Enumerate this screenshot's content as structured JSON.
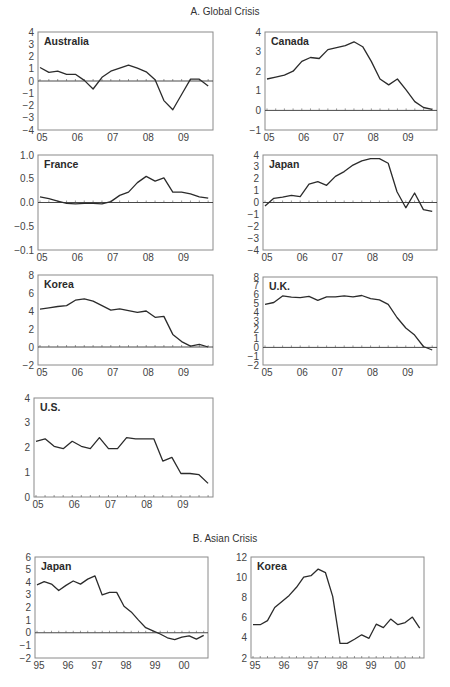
{
  "sections": {
    "a_title": "A. Global Crisis",
    "b_title": "B. Asian Crisis"
  },
  "chart_data": [
    {
      "type": "line",
      "section": "A. Global Crisis",
      "title": "Australia",
      "x_tick_labels": [
        "05",
        "06",
        "07",
        "08",
        "09"
      ],
      "y_tick_labels": [
        "4",
        "3",
        "2",
        "1",
        "0",
        "−1",
        "−2",
        "−3",
        "−4"
      ],
      "ylim": [
        -4,
        4
      ],
      "xlim": [
        2005.0,
        2009.83
      ],
      "x": [
        2005.0,
        2005.25,
        2005.5,
        2005.75,
        2006.0,
        2006.25,
        2006.5,
        2006.75,
        2007.0,
        2007.25,
        2007.5,
        2007.75,
        2008.0,
        2008.25,
        2008.5,
        2008.75,
        2009.0,
        2009.25,
        2009.5,
        2009.75
      ],
      "values": [
        1.1,
        0.7,
        0.8,
        0.55,
        0.55,
        0.05,
        -0.65,
        0.3,
        0.8,
        1.05,
        1.3,
        1.05,
        0.75,
        0.1,
        -1.6,
        -2.35,
        -1.1,
        0.15,
        0.15,
        -0.4
      ]
    },
    {
      "type": "line",
      "section": "A. Global Crisis",
      "title": "Canada",
      "x_tick_labels": [
        "05",
        "06",
        "07",
        "08",
        "09"
      ],
      "y_tick_labels": [
        "4",
        "3",
        "2",
        "1",
        "0",
        "−1"
      ],
      "ylim": [
        -1,
        4
      ],
      "xlim": [
        2005.0,
        2009.83
      ],
      "x": [
        2005.0,
        2005.25,
        2005.5,
        2005.75,
        2006.0,
        2006.25,
        2006.5,
        2006.75,
        2007.0,
        2007.25,
        2007.5,
        2007.75,
        2008.0,
        2008.25,
        2008.5,
        2008.75,
        2009.0,
        2009.25,
        2009.5,
        2009.75
      ],
      "values": [
        1.6,
        1.7,
        1.8,
        2.0,
        2.5,
        2.7,
        2.65,
        3.1,
        3.2,
        3.3,
        3.5,
        3.25,
        2.5,
        1.6,
        1.3,
        1.6,
        1.05,
        0.45,
        0.15,
        0.05
      ]
    },
    {
      "type": "line",
      "section": "A. Global Crisis",
      "title": "France",
      "x_tick_labels": [
        "05",
        "06",
        "07",
        "08",
        "09"
      ],
      "y_tick_labels": [
        "1.0",
        "0.5",
        "0.0",
        "−0.5",
        "−0.1"
      ],
      "ylim": [
        -1.0,
        1.0
      ],
      "xlim": [
        2005.0,
        2009.83
      ],
      "x": [
        2005.0,
        2005.25,
        2005.5,
        2005.75,
        2006.0,
        2006.25,
        2006.5,
        2006.75,
        2007.0,
        2007.25,
        2007.5,
        2007.75,
        2008.0,
        2008.25,
        2008.5,
        2008.75,
        2009.0,
        2009.25,
        2009.5,
        2009.75
      ],
      "values": [
        0.12,
        0.08,
        0.03,
        -0.02,
        -0.03,
        -0.02,
        -0.02,
        -0.03,
        0.02,
        0.15,
        0.22,
        0.42,
        0.55,
        0.45,
        0.52,
        0.22,
        0.22,
        0.18,
        0.12,
        0.09
      ]
    },
    {
      "type": "line",
      "section": "A. Global Crisis",
      "title": "Japan",
      "x_tick_labels": [
        "05",
        "06",
        "07",
        "08",
        "09"
      ],
      "y_tick_labels": [
        "4",
        "3",
        "2",
        "1",
        "0",
        "−1",
        "−2",
        "−3",
        "−4"
      ],
      "ylim": [
        -4,
        4
      ],
      "xlim": [
        2005.0,
        2009.83
      ],
      "x": [
        2005.0,
        2005.25,
        2005.5,
        2005.75,
        2006.0,
        2006.25,
        2006.5,
        2006.75,
        2007.0,
        2007.25,
        2007.5,
        2007.75,
        2008.0,
        2008.25,
        2008.5,
        2008.75,
        2009.0,
        2009.25,
        2009.5,
        2009.75
      ],
      "values": [
        -0.3,
        0.35,
        0.45,
        0.6,
        0.5,
        1.55,
        1.75,
        1.45,
        2.2,
        2.6,
        3.15,
        3.5,
        3.7,
        3.7,
        3.3,
        0.9,
        -0.45,
        0.8,
        -0.6,
        -0.75
      ]
    },
    {
      "type": "line",
      "section": "A. Global Crisis",
      "title": "Korea",
      "x_tick_labels": [
        "05",
        "06",
        "07",
        "08",
        "09"
      ],
      "y_tick_labels": [
        "8",
        "6",
        "4",
        "2",
        "0",
        "−2"
      ],
      "ylim": [
        -2,
        8
      ],
      "xlim": [
        2005.0,
        2009.83
      ],
      "x": [
        2005.0,
        2005.25,
        2005.5,
        2005.75,
        2006.0,
        2006.25,
        2006.5,
        2006.75,
        2007.0,
        2007.25,
        2007.5,
        2007.75,
        2008.0,
        2008.25,
        2008.5,
        2008.75,
        2009.0,
        2009.25,
        2009.5,
        2009.75
      ],
      "values": [
        4.2,
        4.35,
        4.5,
        4.6,
        5.2,
        5.35,
        5.1,
        4.6,
        4.1,
        4.25,
        4.05,
        3.85,
        4.0,
        3.3,
        3.4,
        1.4,
        0.6,
        0.1,
        0.3,
        0.0
      ]
    },
    {
      "type": "line",
      "section": "A. Global Crisis",
      "title": "U.K.",
      "x_tick_labels": [
        "05",
        "06",
        "07",
        "08",
        "09"
      ],
      "y_tick_labels": [
        "8",
        "7",
        "6",
        "5",
        "4",
        "3",
        "2",
        "1",
        "0",
        "−1",
        "−2"
      ],
      "ylim": [
        -2,
        8
      ],
      "xlim": [
        2005.0,
        2009.83
      ],
      "x": [
        2005.0,
        2005.25,
        2005.5,
        2005.75,
        2006.0,
        2006.25,
        2006.5,
        2006.75,
        2007.0,
        2007.25,
        2007.5,
        2007.75,
        2008.0,
        2008.25,
        2008.5,
        2008.75,
        2009.0,
        2009.25,
        2009.5,
        2009.75
      ],
      "values": [
        4.9,
        5.1,
        5.85,
        5.7,
        5.65,
        5.8,
        5.35,
        5.75,
        5.75,
        5.85,
        5.75,
        5.9,
        5.55,
        5.4,
        4.9,
        3.4,
        2.2,
        1.4,
        0.1,
        -0.3
      ]
    },
    {
      "type": "line",
      "section": "A. Global Crisis",
      "title": "U.S.",
      "x_tick_labels": [
        "05",
        "06",
        "07",
        "08",
        "09"
      ],
      "y_tick_labels": [
        "4",
        "3",
        "2",
        "1",
        "0"
      ],
      "ylim": [
        0,
        4
      ],
      "xlim": [
        2005.0,
        2009.83
      ],
      "x": [
        2005.0,
        2005.25,
        2005.5,
        2005.75,
        2006.0,
        2006.25,
        2006.5,
        2006.75,
        2007.0,
        2007.25,
        2007.5,
        2007.75,
        2008.0,
        2008.25,
        2008.5,
        2008.75,
        2009.0,
        2009.25,
        2009.5,
        2009.75
      ],
      "values": [
        2.25,
        2.35,
        2.05,
        1.95,
        2.25,
        2.05,
        1.95,
        2.4,
        1.95,
        1.95,
        2.4,
        2.35,
        2.35,
        2.35,
        1.45,
        1.6,
        0.95,
        0.95,
        0.9,
        0.55
      ]
    },
    {
      "type": "line",
      "section": "B. Asian Crisis",
      "title": "Japan",
      "x_tick_labels": [
        "95",
        "96",
        "97",
        "98",
        "99",
        "00"
      ],
      "y_tick_labels": [
        "6",
        "5",
        "4",
        "3",
        "2",
        "1",
        "0",
        "−1",
        "−2"
      ],
      "ylim": [
        -2,
        6
      ],
      "xlim": [
        1995.0,
        2000.83
      ],
      "x": [
        1995.0,
        1995.25,
        1995.5,
        1995.75,
        1996.0,
        1996.25,
        1996.5,
        1996.75,
        1997.0,
        1997.25,
        1997.5,
        1997.75,
        1998.0,
        1998.25,
        1998.5,
        1998.75,
        1999.0,
        1999.25,
        1999.5,
        1999.75,
        2000.0,
        2000.25,
        2000.5,
        2000.75
      ],
      "values": [
        3.8,
        4.05,
        3.85,
        3.35,
        3.75,
        4.1,
        3.85,
        4.25,
        4.5,
        3.0,
        3.2,
        3.2,
        2.1,
        1.65,
        1.0,
        0.4,
        0.15,
        -0.1,
        -0.4,
        -0.55,
        -0.35,
        -0.25,
        -0.5,
        -0.2
      ]
    },
    {
      "type": "line",
      "section": "B. Asian Crisis",
      "title": "Korea",
      "x_tick_labels": [
        "95",
        "96",
        "97",
        "98",
        "99",
        "00"
      ],
      "y_tick_labels": [
        "12",
        "10",
        "8",
        "6",
        "4",
        "2"
      ],
      "ylim": [
        2,
        12
      ],
      "xlim": [
        1995.0,
        2000.83
      ],
      "x": [
        1995.0,
        1995.25,
        1995.5,
        1995.75,
        1996.0,
        1996.25,
        1996.5,
        1996.75,
        1997.0,
        1997.25,
        1997.5,
        1997.75,
        1998.0,
        1998.25,
        1998.5,
        1998.75,
        1999.0,
        1999.25,
        1999.5,
        1999.75,
        2000.0,
        2000.25,
        2000.5,
        2000.75
      ],
      "values": [
        5.3,
        5.3,
        5.7,
        7.0,
        7.6,
        8.2,
        9.0,
        10.0,
        10.15,
        10.8,
        10.45,
        8.1,
        3.45,
        3.45,
        3.85,
        4.3,
        3.95,
        5.35,
        5.0,
        5.85,
        5.3,
        5.5,
        6.05,
        4.95
      ]
    }
  ],
  "panels": [
    {
      "x0": 38,
      "x1": 213,
      "y0": 32,
      "y1": 130,
      "gap": [
        0,
        3,
        2,
        5
      ]
    },
    {
      "x0": 265,
      "x1": 437,
      "y0": 32,
      "y1": 130
    },
    {
      "x0": 38,
      "x1": 213,
      "y0": 155,
      "y1": 250
    },
    {
      "x0": 263,
      "x1": 437,
      "y0": 155,
      "y1": 250
    },
    {
      "x0": 38,
      "x1": 213,
      "y0": 275,
      "y1": 365
    },
    {
      "x0": 263,
      "x1": 437,
      "y0": 277,
      "y1": 365
    },
    {
      "x0": 34,
      "x1": 213,
      "y0": 398,
      "y1": 497
    },
    {
      "x0": 35,
      "x1": 208,
      "y0": 557,
      "y1": 658
    },
    {
      "x0": 251,
      "x1": 424,
      "y0": 557,
      "y1": 658
    }
  ]
}
